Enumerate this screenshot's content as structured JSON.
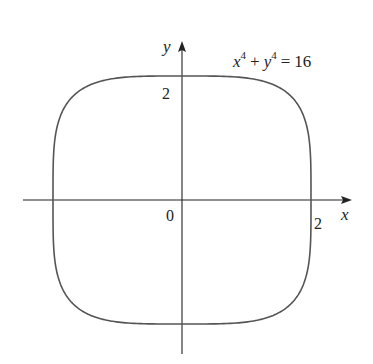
{
  "chart_data": {
    "type": "line",
    "title": "",
    "equation": "x^4 + y^4 = 16",
    "equation_parts": {
      "x": "x",
      "x_exp": "4",
      "plus": "+",
      "y": "y",
      "y_exp": "4",
      "equals": "=",
      "rhs": "16"
    },
    "xlabel": "x",
    "ylabel": "y",
    "origin_label": "0",
    "x_tick_labels": [
      "2"
    ],
    "y_tick_labels": [
      "2"
    ],
    "xlim": [
      -2.8,
      2.6
    ],
    "ylim": [
      -2.5,
      2.6
    ],
    "grid": false,
    "curve": {
      "description": "superellipse x^4 + y^4 = 16",
      "exponent": 4,
      "radius": 2,
      "points": [
        {
          "x": 2,
          "y": 0
        },
        {
          "x": 1.98,
          "y": 0.7
        },
        {
          "x": 1.9,
          "y": 1.2
        },
        {
          "x": 1.68,
          "y": 1.68
        },
        {
          "x": 1.2,
          "y": 1.9
        },
        {
          "x": 0.7,
          "y": 1.98
        },
        {
          "x": 0,
          "y": 2
        },
        {
          "x": -0.7,
          "y": 1.98
        },
        {
          "x": -1.2,
          "y": 1.9
        },
        {
          "x": -1.68,
          "y": 1.68
        },
        {
          "x": -1.9,
          "y": 1.2
        },
        {
          "x": -1.98,
          "y": 0.7
        },
        {
          "x": -2,
          "y": 0
        },
        {
          "x": -1.98,
          "y": -0.7
        },
        {
          "x": -1.9,
          "y": -1.2
        },
        {
          "x": -1.68,
          "y": -1.68
        },
        {
          "x": -1.2,
          "y": -1.9
        },
        {
          "x": -0.7,
          "y": -1.98
        },
        {
          "x": 0,
          "y": -2
        },
        {
          "x": 0.7,
          "y": -1.98
        },
        {
          "x": 1.2,
          "y": -1.9
        },
        {
          "x": 1.68,
          "y": -1.68
        },
        {
          "x": 1.9,
          "y": -1.2
        },
        {
          "x": 1.98,
          "y": -0.7
        }
      ]
    }
  },
  "colors": {
    "curve": "#555555",
    "axis": "#222222",
    "text": "#222222",
    "background": "#ffffff"
  }
}
